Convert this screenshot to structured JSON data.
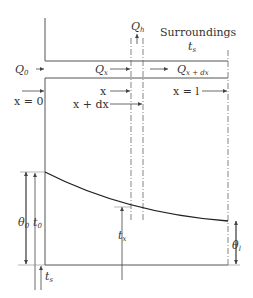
{
  "diagram": {
    "labels": {
      "surroundings": "Surroundings",
      "t_s_top": "t",
      "t_s_top_sub": "s",
      "Q_h": "Q",
      "Q_h_sub": "h",
      "Q_0": "Q",
      "Q_0_sub": "0",
      "Q_x": "Q",
      "Q_x_sub": "x",
      "Q_xdx": "Q",
      "Q_xdx_sub": "x + dx",
      "x_eq_0": "x = 0",
      "x": "x",
      "x_plus_dx": "x + dx",
      "x_eq_l": "x = l",
      "theta_0": "θ",
      "theta_0_sub": "0",
      "t_0": "t",
      "t_0_sub": "0",
      "t_x": "t",
      "t_x_sub": "x",
      "theta_l": "θ",
      "theta_l_sub": "l",
      "t_s_bottom": "t",
      "t_s_bottom_sub": "s"
    },
    "colors": {
      "line": "#555555",
      "curve": "#222222",
      "text": "#333333"
    }
  }
}
